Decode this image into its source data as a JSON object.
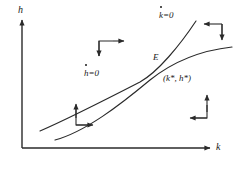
{
  "figure": {
    "kind": "phase-diagram",
    "background_color": "#ffffff",
    "line_color": "#2a2a2a",
    "axes": {
      "y_label": "h",
      "x_label": "k",
      "origin": [
        22,
        148
      ],
      "x_axis_end": [
        212,
        148
      ],
      "y_axis_top": [
        22,
        18
      ]
    },
    "equilibrium": {
      "point_label": "E",
      "coordinate_label": "(k*, h*)",
      "position": [
        162,
        68
      ]
    },
    "nullclines": [
      {
        "name": "k-dot-nullcline",
        "label_base": "k",
        "label_rhs": "=0",
        "label_full": "k̇=0",
        "description": "steep upward sloping curve through E",
        "label_position": [
          159,
          14
        ]
      },
      {
        "name": "h-dot-nullcline",
        "label_base": "h",
        "label_rhs": "=0",
        "label_full": "ḣ=0",
        "description": "flatter concave upward sloping curve through E",
        "label_position": [
          84,
          72
        ]
      }
    ],
    "direction_arrow_groups": [
      {
        "name": "upper-left-quadrant-arrows",
        "arrows": [
          "right",
          "down"
        ],
        "position": [
          92,
          38
        ]
      },
      {
        "name": "upper-right-quadrant-arrows",
        "arrows": [
          "left",
          "down"
        ],
        "position": [
          196,
          20
        ]
      },
      {
        "name": "lower-left-quadrant-arrows",
        "arrows": [
          "up",
          "right"
        ],
        "position": [
          70,
          103
        ]
      },
      {
        "name": "lower-right-quadrant-arrows",
        "arrows": [
          "left",
          "up"
        ],
        "position": [
          183,
          95
        ]
      }
    ]
  }
}
